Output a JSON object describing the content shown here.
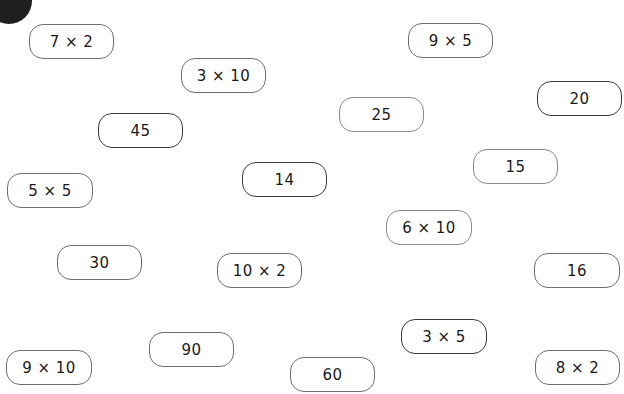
{
  "cards": [
    {
      "id": "c1",
      "label": "7 × 2",
      "x": 29,
      "y": 24,
      "w": 85
    },
    {
      "id": "c2",
      "label": "9 × 5",
      "x": 408,
      "y": 23,
      "w": 85
    },
    {
      "id": "c3",
      "label": "3 × 10",
      "x": 181,
      "y": 58,
      "w": 85
    },
    {
      "id": "c4",
      "label": "20",
      "x": 537,
      "y": 81,
      "w": 85
    },
    {
      "id": "c5",
      "label": "25",
      "x": 339,
      "y": 97,
      "w": 85
    },
    {
      "id": "c6",
      "label": "45",
      "x": 98,
      "y": 113,
      "w": 85
    },
    {
      "id": "c7",
      "label": "15",
      "x": 473,
      "y": 149,
      "w": 85
    },
    {
      "id": "c8",
      "label": "14",
      "x": 242,
      "y": 162,
      "w": 85
    },
    {
      "id": "c9",
      "label": "5 × 5",
      "x": 7,
      "y": 173,
      "w": 86
    },
    {
      "id": "c10",
      "label": "6 × 10",
      "x": 386,
      "y": 210,
      "w": 86
    },
    {
      "id": "c11",
      "label": "30",
      "x": 57,
      "y": 245,
      "w": 85
    },
    {
      "id": "c12",
      "label": "10 × 2",
      "x": 217,
      "y": 253,
      "w": 85
    },
    {
      "id": "c13",
      "label": "16",
      "x": 534,
      "y": 253,
      "w": 86
    },
    {
      "id": "c14",
      "label": "3 × 5",
      "x": 401,
      "y": 319,
      "w": 86
    },
    {
      "id": "c15",
      "label": "90",
      "x": 149,
      "y": 332,
      "w": 85
    },
    {
      "id": "c16",
      "label": "9 × 10",
      "x": 6,
      "y": 350,
      "w": 86
    },
    {
      "id": "c17",
      "label": "8 × 2",
      "x": 535,
      "y": 350,
      "w": 85
    },
    {
      "id": "c18",
      "label": "60",
      "x": 290,
      "y": 357,
      "w": 85
    }
  ]
}
